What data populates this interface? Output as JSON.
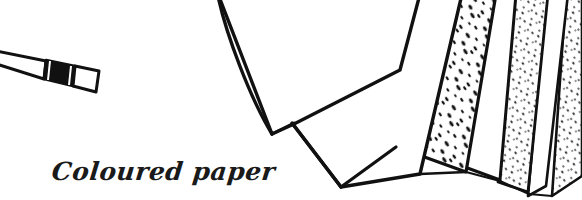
{
  "artwork": {
    "title": "Coloured paper",
    "style": "hand-drawn ink line art",
    "background_color": "#ffffff",
    "ink_color": "#111111",
    "width": 582,
    "height": 200
  },
  "caption": {
    "text": "Coloured paper",
    "color": "#1a1a1a",
    "position": "lower-left"
  },
  "pencil": {
    "name": "pencil-with-eraser",
    "description": "thin tapered pencil body entering from left edge, dark metal ferrule band, light eraser tip",
    "body_color": "#ffffff",
    "ferrule_color": "#111111",
    "eraser_color": "#ffffff",
    "angle_degrees": 18
  },
  "paper_stack": {
    "name": "fanned-paper-sheets",
    "sheet_count": 7,
    "description": "overlapping sheets fanned from a common point, alternating plain and speckled textures",
    "sheets": [
      {
        "id": 1,
        "label": "plain-sheet-front-left",
        "texture": "plain",
        "fill": "#ffffff"
      },
      {
        "id": 2,
        "label": "plain-sheet-second",
        "texture": "plain",
        "fill": "#ffffff"
      },
      {
        "id": 3,
        "label": "speckled-sheet-large",
        "texture": "speckled",
        "fill": "#ffffff"
      },
      {
        "id": 4,
        "label": "plain-sheet-narrow",
        "texture": "plain",
        "fill": "#ffffff"
      },
      {
        "id": 5,
        "label": "speckled-sheet-fine",
        "texture": "speckled-fine",
        "fill": "#ffffff"
      },
      {
        "id": 6,
        "label": "plain-sheet-thin",
        "texture": "plain",
        "fill": "#ffffff"
      },
      {
        "id": 7,
        "label": "speckled-sheet-edge",
        "texture": "speckled-fine",
        "fill": "#ffffff"
      }
    ],
    "speckle_color": "#111111"
  }
}
